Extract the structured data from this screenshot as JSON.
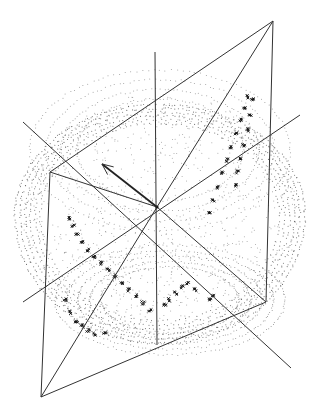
{
  "figure": {
    "width": 309,
    "height": 415,
    "background": "#ffffff",
    "line_color": "#333333",
    "point_color": "#444444",
    "cluster_color": "#111111",
    "center": [
      157,
      207
    ],
    "point_cloud": {
      "shape": "ellipsoid",
      "cx": 160,
      "cy": 215,
      "rx": 145,
      "ry": 135,
      "top_cap_cy": 150,
      "top_cap_rx": 130,
      "top_cap_ry": 80,
      "bottom_cap_cy": 300,
      "bottom_cap_rx": 115,
      "bottom_cap_ry": 55
    },
    "axes": [
      {
        "name": "vertical-axis",
        "x1": 155,
        "y1": 52,
        "x2": 157,
        "y2": 345
      },
      {
        "name": "diagonal-axis-1",
        "x1": 23,
        "y1": 302,
        "x2": 300,
        "y2": 115
      },
      {
        "name": "diagonal-axis-2",
        "x1": 23,
        "y1": 122,
        "x2": 291,
        "y2": 368
      }
    ],
    "plane": {
      "corners": [
        [
          273,
          21
        ],
        [
          266,
          302
        ],
        [
          41,
          397
        ],
        [
          50,
          172
        ]
      ],
      "spokes_to_center": true
    },
    "arrow": {
      "x1": 157,
      "y1": 207,
      "x2": 102,
      "y2": 164
    },
    "clusters": [
      {
        "name": "upper-right-cluster",
        "points": [
          [
            247,
            97
          ],
          [
            244,
            108
          ],
          [
            240,
            120
          ],
          [
            236,
            133
          ],
          [
            231,
            147
          ],
          [
            227,
            160
          ],
          [
            222,
            173
          ],
          [
            217,
            187
          ],
          [
            213,
            200
          ],
          [
            209,
            213
          ],
          [
            252,
            100
          ],
          [
            250,
            115
          ],
          [
            247,
            130
          ],
          [
            244,
            145
          ],
          [
            241,
            158
          ],
          [
            238,
            172
          ],
          [
            235,
            185
          ]
        ]
      },
      {
        "name": "left-cluster",
        "points": [
          [
            70,
            218
          ],
          [
            73,
            226
          ],
          [
            77,
            234
          ],
          [
            82,
            242
          ],
          [
            88,
            250
          ],
          [
            94,
            257
          ],
          [
            101,
            263
          ],
          [
            108,
            270
          ],
          [
            115,
            276
          ],
          [
            122,
            283
          ],
          [
            129,
            290
          ],
          [
            136,
            296
          ],
          [
            143,
            303
          ],
          [
            150,
            310
          ]
        ]
      },
      {
        "name": "lower-left-cluster",
        "points": [
          [
            65,
            300
          ],
          [
            70,
            312
          ],
          [
            76,
            322
          ],
          [
            82,
            326
          ],
          [
            88,
            330
          ],
          [
            95,
            334
          ],
          [
            105,
            332
          ]
        ]
      },
      {
        "name": "lower-right-cluster",
        "points": [
          [
            165,
            305
          ],
          [
            170,
            300
          ],
          [
            176,
            293
          ],
          [
            182,
            287
          ],
          [
            188,
            283
          ],
          [
            195,
            290
          ],
          [
            210,
            300
          ],
          [
            213,
            296
          ]
        ]
      }
    ]
  }
}
